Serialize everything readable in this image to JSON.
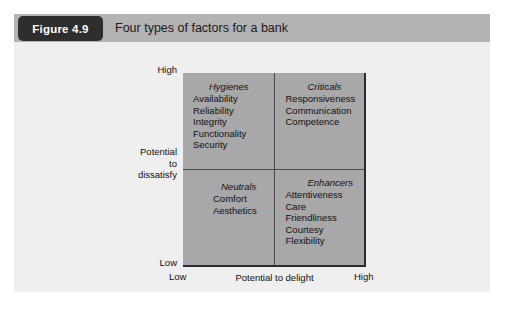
{
  "figure": {
    "number_label": "Figure 4.9",
    "title": "Four types of factors for a bank"
  },
  "chart_data": {
    "type": "scatter",
    "title": "Four types of factors for a bank",
    "xlabel": "Potential to delight",
    "ylabel": "Potential to dissatisfy",
    "x_tick_labels": [
      "Low",
      "High"
    ],
    "y_tick_labels": [
      "Low",
      "High"
    ],
    "grid": true,
    "legend": "none",
    "quadrants": [
      {
        "id": "hygienes",
        "position": "top-left",
        "x_level": "Low",
        "y_level": "High",
        "title": "Hygienes",
        "items": [
          "Availability",
          "Reliability",
          "Integrity",
          "Functionality",
          "Security"
        ]
      },
      {
        "id": "criticals",
        "position": "top-right",
        "x_level": "High",
        "y_level": "High",
        "title": "Criticals",
        "items": [
          "Responsiveness",
          "Communication",
          "Competence"
        ]
      },
      {
        "id": "neutrals",
        "position": "bottom-left",
        "x_level": "Low",
        "y_level": "Low",
        "title": "Neutrals",
        "items": [
          "Comfort",
          "Aesthetics"
        ]
      },
      {
        "id": "enhancers",
        "position": "bottom-right",
        "x_level": "High",
        "y_level": "Low",
        "title": "Enhancers",
        "items": [
          "Attentiveness",
          "Care",
          "Friendliness",
          "Courtesy",
          "Flexibility"
        ]
      }
    ]
  },
  "axes": {
    "y_high": "High",
    "y_low": "Low",
    "y_title_line1": "Potential",
    "y_title_line2": "to",
    "y_title_line3": "dissatisfy",
    "x_low": "Low",
    "x_high": "High",
    "x_title": "Potential to delight"
  },
  "colors": {
    "panel_background": "#eeeeee",
    "header_background": "#b3b3b3",
    "tab_background": "#2e2e2e",
    "tab_text": "#ffffff",
    "plot_fill": "#a8a8a8",
    "plot_border": "#2b2b2b",
    "divider": "#4a4a4a",
    "text": "#111111"
  }
}
